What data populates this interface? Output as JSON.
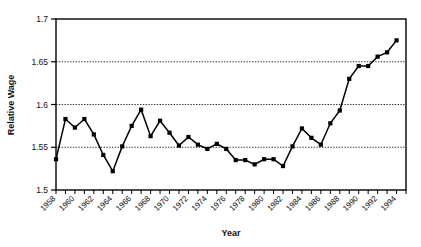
{
  "chart_data": {
    "type": "line",
    "title": "",
    "xlabel": "Year",
    "ylabel": "Relative Wage",
    "xlim": [
      1958,
      1995
    ],
    "ylim": [
      1.5,
      1.7
    ],
    "grid": true,
    "grid_axis": "y",
    "legend": "none",
    "marker": "square",
    "line_color": "#000000",
    "marker_color": "#000000",
    "background_color": "#ffffff",
    "ytick_labels": [
      "1.5",
      "1.55",
      "1.6",
      "1.65",
      "1.7"
    ],
    "ytick_values": [
      1.5,
      1.55,
      1.6,
      1.65,
      1.7
    ],
    "xtick_labels": [
      "1958",
      "1960",
      "1962",
      "1964",
      "1966",
      "1968",
      "1970",
      "1972",
      "1974",
      "1976",
      "1978",
      "1980",
      "1982",
      "1984",
      "1986",
      "1988",
      "1990",
      "1992",
      "1994"
    ],
    "xtick_values": [
      1958,
      1960,
      1962,
      1964,
      1966,
      1968,
      1970,
      1972,
      1974,
      1976,
      1978,
      1980,
      1982,
      1984,
      1986,
      1988,
      1990,
      1992,
      1994
    ],
    "x": [
      1958,
      1959,
      1960,
      1961,
      1962,
      1963,
      1964,
      1965,
      1966,
      1967,
      1968,
      1969,
      1970,
      1971,
      1972,
      1973,
      1974,
      1975,
      1976,
      1977,
      1978,
      1979,
      1980,
      1981,
      1982,
      1983,
      1984,
      1985,
      1986,
      1987,
      1988,
      1989,
      1990,
      1991,
      1992,
      1993,
      1994
    ],
    "values": [
      1.536,
      1.583,
      1.573,
      1.583,
      1.565,
      1.541,
      1.522,
      1.551,
      1.575,
      1.594,
      1.563,
      1.581,
      1.567,
      1.552,
      1.562,
      1.553,
      1.548,
      1.554,
      1.548,
      1.535,
      1.535,
      1.53,
      1.536,
      1.536,
      1.528,
      1.551,
      1.572,
      1.561,
      1.553,
      1.578,
      1.593,
      1.63,
      1.645,
      1.645,
      1.656,
      1.661,
      1.675
    ]
  },
  "axes": {
    "ylabel": "Relative Wage",
    "xlabel": "Year"
  }
}
